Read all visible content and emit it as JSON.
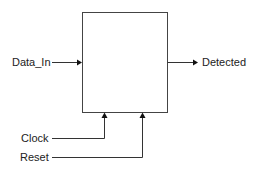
{
  "diagram": {
    "type": "block-diagram",
    "block": {
      "label": ""
    },
    "inputs": [
      {
        "name": "Data_In",
        "side": "left"
      },
      {
        "name": "Clock",
        "side": "bottom"
      },
      {
        "name": "Reset",
        "side": "bottom"
      }
    ],
    "outputs": [
      {
        "name": "Detected",
        "side": "right"
      }
    ],
    "colors": {
      "line": "#333333",
      "box": "#444444",
      "text": "#222222",
      "background": "#ffffff"
    }
  }
}
